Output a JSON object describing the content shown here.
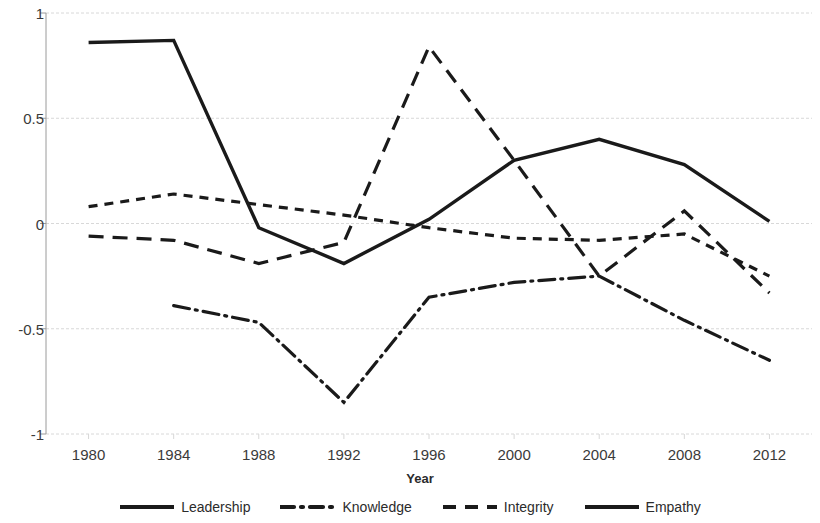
{
  "chart_data": {
    "type": "line",
    "title": "",
    "xlabel": "Year",
    "ylabel": "",
    "x": [
      1980,
      1984,
      1988,
      1992,
      1996,
      2000,
      2004,
      2008,
      2012
    ],
    "categories": [
      "1980",
      "1984",
      "1988",
      "1992",
      "1996",
      "2000",
      "2004",
      "2008",
      "2012"
    ],
    "ylim": [
      -1,
      1
    ],
    "yticks": [
      1,
      0.5,
      0,
      -0.5,
      -1
    ],
    "ytick_labels": [
      "1",
      "0.5",
      "0",
      "-0.5",
      "-1"
    ],
    "grid": true,
    "grid_axis": "y",
    "legend_position": "bottom",
    "series": [
      {
        "name": "Leadership",
        "style": "dash-dot",
        "color": "#1a1a1a",
        "values": [
          null,
          -0.39,
          -0.47,
          -0.85,
          -0.35,
          -0.28,
          -0.25,
          -0.46,
          -0.65
        ]
      },
      {
        "name": "Knowledge",
        "style": "long-dash",
        "color": "#1a1a1a",
        "values": [
          -0.06,
          -0.08,
          -0.19,
          -0.09,
          0.84,
          0.3,
          -0.25,
          0.06,
          -0.33
        ]
      },
      {
        "name": "Integrity",
        "style": "dash",
        "color": "#1a1a1a",
        "values": [
          0.08,
          0.14,
          0.09,
          0.04,
          -0.02,
          -0.07,
          -0.08,
          -0.05,
          -0.25
        ]
      },
      {
        "name": "Empathy",
        "style": "solid",
        "color": "#1a1a1a",
        "values": [
          0.86,
          0.87,
          -0.02,
          -0.19,
          0.02,
          0.3,
          0.4,
          0.28,
          0.01
        ]
      }
    ]
  },
  "axis": {
    "x_title": "Year",
    "ytick_labels": [
      "1",
      "0.5",
      "0",
      "-0.5",
      "-1"
    ],
    "xtick_labels": [
      "1980",
      "1984",
      "1988",
      "1992",
      "1996",
      "2000",
      "2004",
      "2008",
      "2012"
    ]
  },
  "legend": {
    "items": [
      {
        "label": "Leadership",
        "style": "solid"
      },
      {
        "label": "Knowledge",
        "style": "dash-dot"
      },
      {
        "label": "Integrity",
        "style": "dash"
      },
      {
        "label": "Empathy",
        "style": "solid"
      }
    ]
  },
  "colors": {
    "line": "#1a1a1a",
    "grid": "#d8d8d8",
    "axis": "#9a9a9a",
    "text": "#2b2b2b"
  }
}
